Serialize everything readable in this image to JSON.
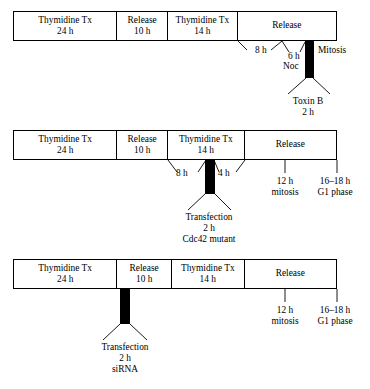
{
  "figure": {
    "type": "experimental-timeline-diagram",
    "panel_count": 3
  },
  "panels": [
    {
      "id": "panel-1",
      "name": "toxin-b-nocodazole-timeline",
      "phases": [
        {
          "label": "Thymidine Tx",
          "duration": "24 h"
        },
        {
          "label": "Release",
          "duration": "10 h"
        },
        {
          "label": "Thymidine Tx",
          "duration": "14 h"
        },
        {
          "label": "Release",
          "duration": ""
        }
      ],
      "interval_labels": [
        {
          "text": "8 h"
        },
        {
          "text": "6 h"
        }
      ],
      "treatment_block": {
        "agent": "Noc",
        "callout_title": "Toxin B",
        "callout_duration": "2 h"
      },
      "endpoint_labels": [
        {
          "text": "Mitosis"
        }
      ]
    },
    {
      "id": "panel-2",
      "name": "cdc42-mutant-transfection-timeline",
      "phases": [
        {
          "label": "Thymidine Tx",
          "duration": "24 h"
        },
        {
          "label": "Release",
          "duration": "10 h"
        },
        {
          "label": "Thymidine Tx",
          "duration": "14 h"
        },
        {
          "label": "Release",
          "duration": ""
        }
      ],
      "interval_labels": [
        {
          "text": "8 h"
        },
        {
          "text": "4 h"
        }
      ],
      "treatment_block": {
        "callout_title": "Transfection",
        "callout_duration": "2 h",
        "callout_agent": "Cdc42 mutant"
      },
      "timepoints": [
        {
          "time": "12 h",
          "event": "mitosis"
        },
        {
          "time": "16–18 h",
          "event": "G1 phase"
        }
      ]
    },
    {
      "id": "panel-3",
      "name": "sirna-transfection-timeline",
      "phases": [
        {
          "label": "Thymidine Tx",
          "duration": "24 h"
        },
        {
          "label": "Release",
          "duration": "10 h"
        },
        {
          "label": "Thymidine Tx",
          "duration": "14 h"
        },
        {
          "label": "Release",
          "duration": ""
        }
      ],
      "treatment_block": {
        "callout_title": "Transfection",
        "callout_duration": "2 h",
        "callout_agent": "siRNA"
      },
      "timepoints": [
        {
          "time": "12 h",
          "event": "mitosis"
        },
        {
          "time": "16–18 h",
          "event": "G1 phase"
        }
      ]
    }
  ]
}
